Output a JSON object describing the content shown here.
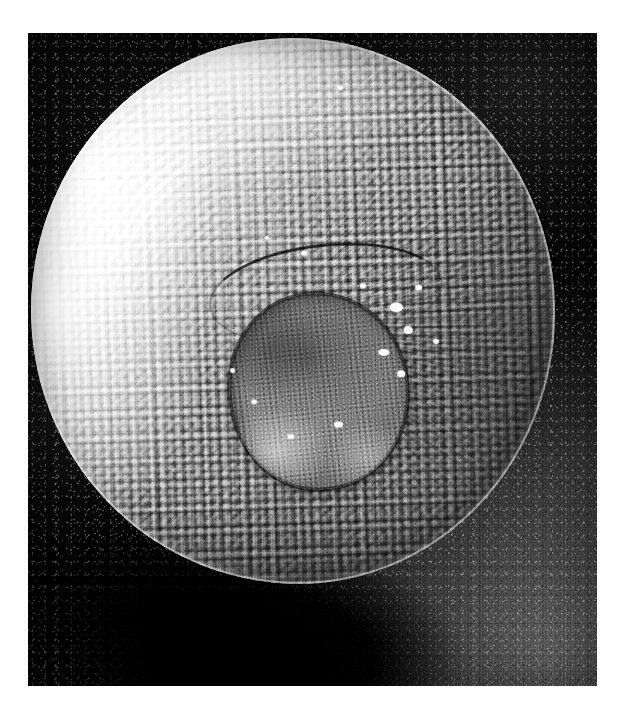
{
  "figure": {
    "kind": "scanning-electron-micrograph",
    "color_mode": "black-and-white",
    "caption": "",
    "scale_bar": "",
    "magnification": "",
    "label": ""
  },
  "plate": {
    "left": 28,
    "top": 33,
    "width": 569,
    "height": 653,
    "border": "none",
    "page_background": "#fefefe"
  },
  "colors": {
    "page_background": "#fefefe",
    "plate_background": "#0b0b0b",
    "substrate_dark": "#0c0c0c",
    "substrate_light": "#787878",
    "specimen_highlight": "#f4f4f4",
    "specimen_midtone": "#9a9a9a",
    "specimen_shadow": "#5e5e5e",
    "plug_fill": "#7b7b7b",
    "plug_rim": "#141414",
    "fleck": "#fcfcfc"
  },
  "specimen": {
    "name": "spherical-body",
    "center_x": 293,
    "center_y": 311,
    "radius_x": 262,
    "radius_y": 273,
    "surface_texture": "verrucate-granular",
    "rim_highlight_side": "left",
    "shadow_side": "lower-right"
  },
  "operculum": {
    "name": "central-plug",
    "center_x": 316,
    "center_y": 392,
    "radius_x": 89,
    "radius_y": 98,
    "rim": "dark-outline",
    "texture": "mottled-granular",
    "groove": "dark-crescent-above"
  },
  "debris": {
    "label": "bright particulate flecks",
    "count": 14,
    "region": "right-of-central-plug"
  },
  "shadow": {
    "name": "cast-shadow",
    "position": "beneath-specimen",
    "tone": "near-black"
  }
}
